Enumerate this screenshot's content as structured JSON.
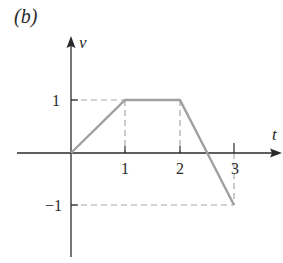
{
  "figure": {
    "panel_label": "(b)",
    "y_axis_label": "v",
    "x_axis_label": "t",
    "x_ticks": [
      {
        "value": 1,
        "label": "1"
      },
      {
        "value": 2,
        "label": "2"
      },
      {
        "value": 3,
        "label": "3"
      }
    ],
    "y_ticks": [
      {
        "value": 1,
        "label": "1"
      },
      {
        "value": -1,
        "label": "−1"
      }
    ],
    "waveform_points": [
      [
        0,
        0
      ],
      [
        1,
        1
      ],
      [
        2,
        1
      ],
      [
        3,
        -1
      ]
    ],
    "colors": {
      "axes": "#2a2a2a",
      "waveform": "#a0a0a0",
      "guides": "#a8a8a8"
    }
  }
}
